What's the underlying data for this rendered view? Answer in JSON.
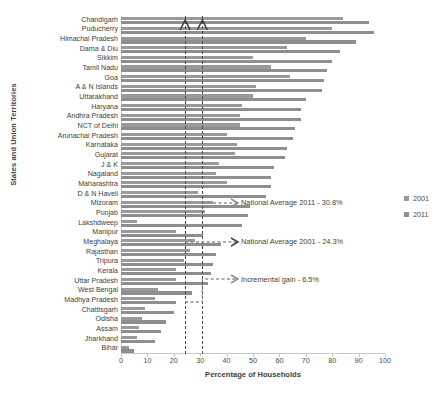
{
  "chart_data": {
    "type": "bar",
    "title": "",
    "xlabel": "Percentage of Households",
    "ylabel": "States and Union Territories",
    "xlim": [
      0,
      100
    ],
    "xticks": [
      0,
      10,
      20,
      30,
      40,
      50,
      60,
      70,
      80,
      90,
      100
    ],
    "grid": false,
    "legend_position": "right",
    "orientation": "horizontal",
    "categories": [
      "Chandigarh",
      "Puducherry",
      "Himachal Pradesh",
      "Dama & Diu",
      "Sikkim",
      "Tamil Nadu",
      "Goa",
      "A & N Islands",
      "Uttarakhand",
      "Haryana",
      "Andhra Pradesh",
      "NCT of Delhi",
      "Arunachal Pradesh",
      "Karnataka",
      "Gujarat",
      "J & K",
      "Nagaland",
      "Maharashtra",
      "D & N Haveli",
      "Mizoram",
      "Punjab",
      "Lakshdweep",
      "Manipur",
      "Meghalaya",
      "Rajasthan",
      "Tripura",
      "Kerala",
      "Uttar Pradesh",
      "West Bengal",
      "Madhya Pradesh",
      "Chattisgarh",
      "Odisha",
      "Assam",
      "Jharkhand",
      "Bihar"
    ],
    "series": [
      {
        "name": "2001",
        "color": "#9a9a9a",
        "values": [
          84.0,
          80.0,
          70.0,
          63.0,
          50.0,
          57.0,
          64.0,
          51.0,
          50.0,
          46.0,
          45.0,
          45.0,
          40.0,
          44.0,
          43.0,
          37.0,
          36.0,
          40.0,
          29.0,
          35.0,
          32.0,
          6.0,
          21.0,
          28.0,
          26.0,
          24.0,
          21.0,
          21.0,
          14.0,
          13.0,
          9.0,
          8.0,
          7.0,
          6.0,
          3.0
        ]
      },
      {
        "name": "2011",
        "color": "#8e8e8e",
        "values": [
          94.0,
          96.0,
          89.0,
          83.0,
          80.0,
          78.0,
          77.0,
          76.0,
          70.0,
          68.0,
          68.0,
          66.0,
          65.0,
          63.0,
          62.0,
          58.0,
          57.0,
          57.0,
          55.0,
          49.0,
          48.0,
          46.0,
          31.0,
          38.0,
          36.0,
          35.0,
          34.0,
          33.0,
          27.0,
          21.0,
          20.0,
          17.0,
          15.0,
          13.0,
          5.0
        ]
      }
    ],
    "reference_lines": [
      {
        "name": "National Average 2001",
        "value": 24.3,
        "style": "dashed"
      },
      {
        "name": "National Average 2011",
        "value": 30.8,
        "style": "dashed"
      }
    ],
    "annotations": [
      {
        "id": "national_average_2011",
        "text": "National Average 2011 - 30.8%"
      },
      {
        "id": "national_average_2001",
        "text": "National Average 2001 - 24.3%"
      },
      {
        "id": "incremental_gain",
        "text": "Incremental gain - 6.5%"
      }
    ],
    "legend": [
      {
        "label": "2001",
        "color": "#9a9a9a"
      },
      {
        "label": "2011",
        "color": "#8e8e8e"
      }
    ]
  }
}
